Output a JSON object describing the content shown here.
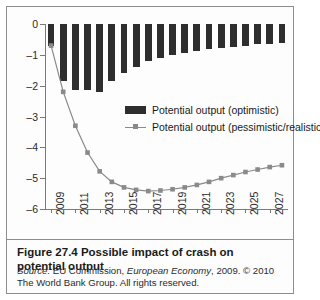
{
  "figure": {
    "caption": "Figure 27.4  Possible impact of crash on potential output",
    "source_label": "Source:",
    "source_text": " EU Commission, European Economy, 2009. © 2010 The World Bank Group. All rights reserved.",
    "source_italic_1": "Source:",
    "source_italic_2": "European Economy"
  },
  "colors": {
    "bar": "#2e2e2e",
    "line": "#8a8a8a",
    "axis": "#7a7a7a",
    "frame": "#8d8d8d",
    "background": "#fdfdfd",
    "text": "#1a1a1a"
  },
  "legend": {
    "position": "inside-center-right",
    "items": [
      {
        "label": "Potential output (optimistic)",
        "marker": "bar-swatch"
      },
      {
        "label": "Potential output (pessimistic/realistic)",
        "marker": "line-square-marker"
      }
    ]
  },
  "axis": {
    "y_ticks": [
      "0",
      "–1",
      "–2",
      "–3",
      "–4",
      "–5",
      "–6"
    ],
    "y_tick_values": [
      0,
      -1,
      -2,
      -3,
      -4,
      -5,
      -6
    ],
    "x_ticks": [
      "2009",
      "2011",
      "2013",
      "2015",
      "2017",
      "2019",
      "2021",
      "2023",
      "2025",
      "2027"
    ],
    "x_tick_values": [
      2009,
      2011,
      2013,
      2015,
      2017,
      2019,
      2021,
      2023,
      2025,
      2027
    ]
  },
  "chart_data": {
    "type": "bar",
    "title": "Possible impact of crash on potential output",
    "xlabel": "",
    "ylabel": "",
    "ylim": [
      -6,
      0
    ],
    "xlim": [
      2008.5,
      2028.5
    ],
    "grid": false,
    "legend_position": "inside-center-right",
    "categories": [
      "2009",
      "2010",
      "2011",
      "2012",
      "2013",
      "2014",
      "2015",
      "2016",
      "2017",
      "2018",
      "2019",
      "2020",
      "2021",
      "2022",
      "2023",
      "2024",
      "2025",
      "2026",
      "2027",
      "2028"
    ],
    "x": [
      2009,
      2010,
      2011,
      2012,
      2013,
      2014,
      2015,
      2016,
      2017,
      2018,
      2019,
      2020,
      2021,
      2022,
      2023,
      2024,
      2025,
      2026,
      2027,
      2028
    ],
    "series": [
      {
        "name": "Potential output (optimistic)",
        "type": "bar",
        "values": [
          -0.7,
          -1.85,
          -2.15,
          -2.15,
          -2.2,
          -1.85,
          -1.6,
          -1.4,
          -1.2,
          -1.1,
          -1.0,
          -0.95,
          -0.88,
          -0.82,
          -0.78,
          -0.74,
          -0.7,
          -0.66,
          -0.64,
          -0.62
        ]
      },
      {
        "name": "Potential output (pessimistic/realistic)",
        "type": "line",
        "marker": "square",
        "values": [
          -0.7,
          -2.2,
          -3.3,
          -4.17,
          -4.78,
          -5.12,
          -5.3,
          -5.38,
          -5.42,
          -5.4,
          -5.36,
          -5.3,
          -5.22,
          -5.12,
          -5.0,
          -4.9,
          -4.8,
          -4.72,
          -4.64,
          -4.58
        ]
      }
    ]
  }
}
